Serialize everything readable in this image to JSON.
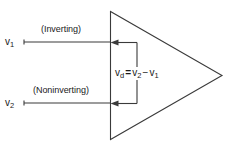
{
  "figure": {
    "type": "circuit-diagram",
    "background_color": "#ffffff",
    "line_color": "#3a3a3a",
    "text_color": "#1a1a1a"
  },
  "inputs": {
    "inverting": {
      "symbol": "v",
      "subscript": "1",
      "annotation": "(Inverting)"
    },
    "noninverting": {
      "symbol": "v",
      "subscript": "2",
      "annotation": "(Noninverting)"
    }
  },
  "equation": {
    "lhs_symbol": "v",
    "lhs_subscript": "d",
    "equals": "=",
    "term1_symbol": "v",
    "term1_subscript": "2",
    "operator": "−",
    "term2_symbol": "v",
    "term2_subscript": "1"
  },
  "amplifier": {
    "shape": "triangle",
    "apex_direction": "right"
  }
}
